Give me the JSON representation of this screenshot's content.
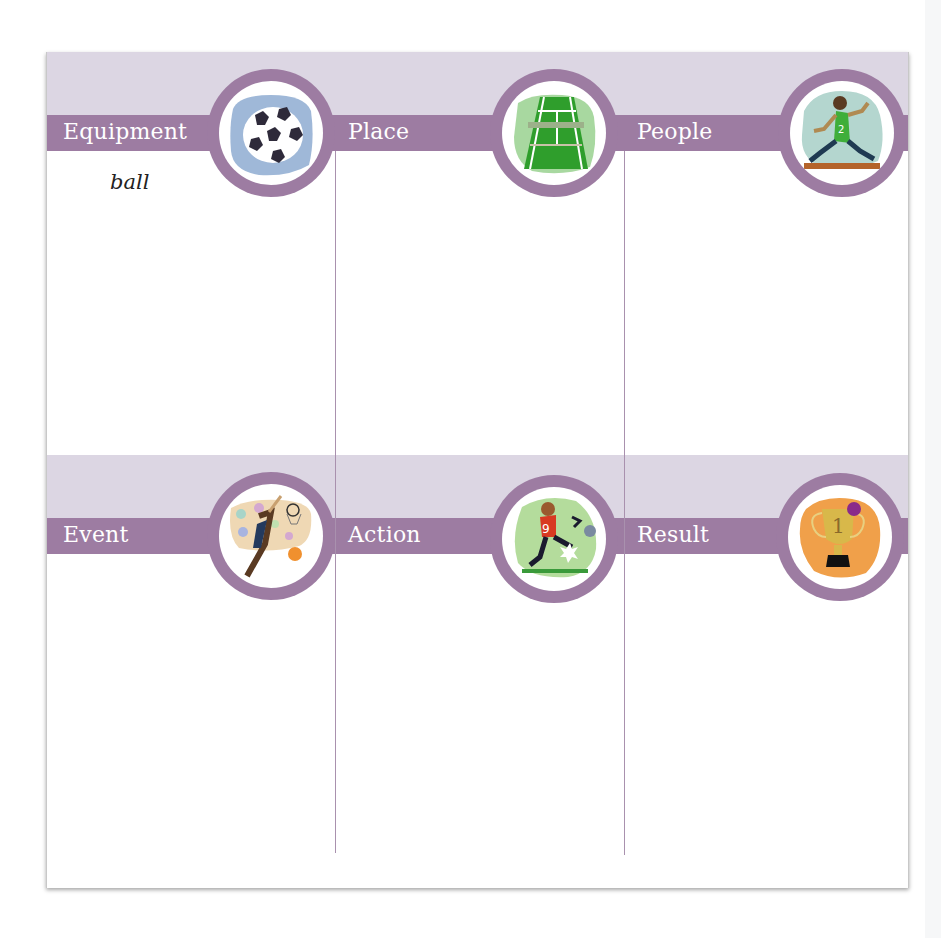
{
  "worksheet": {
    "rows": [
      {
        "columns": [
          {
            "label": "Equipment",
            "icon": "soccer-ball-icon",
            "entry": "ball"
          },
          {
            "label": "Place",
            "icon": "tennis-court-icon",
            "entry": ""
          },
          {
            "label": "People",
            "icon": "runner-icon",
            "entry": ""
          }
        ]
      },
      {
        "columns": [
          {
            "label": "Event",
            "icon": "basketball-player-icon",
            "entry": ""
          },
          {
            "label": "Action",
            "icon": "soccer-kick-icon",
            "entry": ""
          },
          {
            "label": "Result",
            "icon": "trophy-icon",
            "entry": ""
          }
        ]
      }
    ],
    "colors": {
      "band_light": "#dcd6e3",
      "band_purple": "#9d7ca2",
      "divider": "#a991ae",
      "label_text": "#ffffff"
    }
  }
}
